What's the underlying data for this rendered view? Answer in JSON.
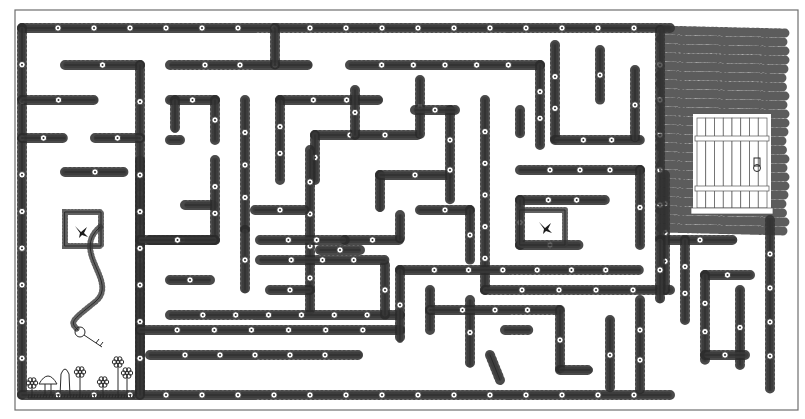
{
  "title": "Flower Vine Maze",
  "colors": {
    "ink": "#2a2a2a",
    "frame": "#6e6e6e",
    "background": "#ffffff"
  },
  "frame": {
    "x": 15,
    "y": 10,
    "w": 783,
    "h": 400
  },
  "walls": [
    [
      [
        22,
        28
      ],
      [
        670,
        28
      ]
    ],
    [
      [
        22,
        28
      ],
      [
        22,
        395
      ]
    ],
    [
      [
        22,
        395
      ],
      [
        670,
        395
      ]
    ],
    [
      [
        140,
        395
      ],
      [
        140,
        160
      ]
    ],
    [
      [
        22,
        100
      ],
      [
        95,
        100
      ]
    ],
    [
      [
        22,
        138
      ],
      [
        65,
        138
      ]
    ],
    [
      [
        65,
        65
      ],
      [
        140,
        65
      ]
    ],
    [
      [
        140,
        65
      ],
      [
        140,
        395
      ]
    ],
    [
      [
        95,
        138
      ],
      [
        140,
        138
      ]
    ],
    [
      [
        65,
        172
      ],
      [
        125,
        172
      ]
    ],
    [
      [
        170,
        65
      ],
      [
        310,
        65
      ]
    ],
    [
      [
        275,
        28
      ],
      [
        275,
        65
      ]
    ],
    [
      [
        170,
        100
      ],
      [
        215,
        100
      ]
    ],
    [
      [
        215,
        100
      ],
      [
        215,
        140
      ]
    ],
    [
      [
        170,
        140
      ],
      [
        180,
        140
      ]
    ],
    [
      [
        175,
        100
      ],
      [
        175,
        130
      ]
    ],
    [
      [
        245,
        100
      ],
      [
        245,
        230
      ]
    ],
    [
      [
        185,
        205
      ],
      [
        215,
        205
      ]
    ],
    [
      [
        215,
        160
      ],
      [
        215,
        240
      ]
    ],
    [
      [
        150,
        240
      ],
      [
        215,
        240
      ]
    ],
    [
      [
        140,
        240
      ],
      [
        215,
        240
      ]
    ],
    [
      [
        170,
        280
      ],
      [
        210,
        280
      ]
    ],
    [
      [
        245,
        230
      ],
      [
        245,
        290
      ]
    ],
    [
      [
        280,
        100
      ],
      [
        380,
        100
      ]
    ],
    [
      [
        280,
        100
      ],
      [
        280,
        180
      ]
    ],
    [
      [
        315,
        135
      ],
      [
        420,
        135
      ]
    ],
    [
      [
        315,
        135
      ],
      [
        315,
        180
      ]
    ],
    [
      [
        350,
        65
      ],
      [
        540,
        65
      ]
    ],
    [
      [
        420,
        80
      ],
      [
        420,
        135
      ]
    ],
    [
      [
        310,
        150
      ],
      [
        310,
        310
      ]
    ],
    [
      [
        255,
        210
      ],
      [
        305,
        210
      ]
    ],
    [
      [
        380,
        175
      ],
      [
        380,
        210
      ]
    ],
    [
      [
        380,
        175
      ],
      [
        450,
        175
      ]
    ],
    [
      [
        450,
        110
      ],
      [
        450,
        200
      ]
    ],
    [
      [
        415,
        110
      ],
      [
        455,
        110
      ]
    ],
    [
      [
        345,
        240
      ],
      [
        400,
        240
      ]
    ],
    [
      [
        400,
        215
      ],
      [
        400,
        240
      ]
    ],
    [
      [
        260,
        240
      ],
      [
        345,
        240
      ]
    ],
    [
      [
        355,
        90
      ],
      [
        355,
        135
      ]
    ],
    [
      [
        540,
        65
      ],
      [
        540,
        145
      ]
    ],
    [
      [
        485,
        100
      ],
      [
        485,
        290
      ]
    ],
    [
      [
        520,
        110
      ],
      [
        520,
        135
      ]
    ],
    [
      [
        555,
        45
      ],
      [
        555,
        140
      ]
    ],
    [
      [
        555,
        140
      ],
      [
        640,
        140
      ]
    ],
    [
      [
        600,
        50
      ],
      [
        600,
        100
      ]
    ],
    [
      [
        635,
        70
      ],
      [
        635,
        140
      ]
    ],
    [
      [
        520,
        170
      ],
      [
        640,
        170
      ]
    ],
    [
      [
        640,
        170
      ],
      [
        640,
        245
      ]
    ],
    [
      [
        520,
        200
      ],
      [
        605,
        200
      ]
    ],
    [
      [
        520,
        200
      ],
      [
        520,
        245
      ]
    ],
    [
      [
        520,
        245
      ],
      [
        580,
        245
      ]
    ],
    [
      [
        485,
        290
      ],
      [
        670,
        290
      ]
    ],
    [
      [
        420,
        210
      ],
      [
        470,
        210
      ]
    ],
    [
      [
        470,
        210
      ],
      [
        470,
        260
      ]
    ],
    [
      [
        140,
        330
      ],
      [
        400,
        330
      ]
    ],
    [
      [
        170,
        315
      ],
      [
        400,
        315
      ]
    ],
    [
      [
        385,
        265
      ],
      [
        385,
        315
      ]
    ],
    [
      [
        260,
        260
      ],
      [
        385,
        260
      ]
    ],
    [
      [
        270,
        290
      ],
      [
        310,
        290
      ]
    ],
    [
      [
        320,
        250
      ],
      [
        360,
        250
      ]
    ],
    [
      [
        150,
        355
      ],
      [
        360,
        355
      ]
    ],
    [
      [
        400,
        270
      ],
      [
        640,
        270
      ]
    ],
    [
      [
        400,
        270
      ],
      [
        400,
        340
      ]
    ],
    [
      [
        430,
        290
      ],
      [
        430,
        330
      ]
    ],
    [
      [
        470,
        300
      ],
      [
        470,
        365
      ]
    ],
    [
      [
        430,
        310
      ],
      [
        560,
        310
      ]
    ],
    [
      [
        560,
        310
      ],
      [
        560,
        370
      ]
    ],
    [
      [
        505,
        330
      ],
      [
        530,
        330
      ]
    ],
    [
      [
        490,
        355
      ],
      [
        500,
        380
      ]
    ],
    [
      [
        560,
        370
      ],
      [
        590,
        370
      ]
    ],
    [
      [
        665,
        240
      ],
      [
        735,
        240
      ]
    ],
    [
      [
        665,
        175
      ],
      [
        665,
        290
      ]
    ],
    [
      [
        685,
        240
      ],
      [
        685,
        320
      ]
    ],
    [
      [
        705,
        275
      ],
      [
        750,
        275
      ]
    ],
    [
      [
        705,
        275
      ],
      [
        705,
        360
      ]
    ],
    [
      [
        740,
        290
      ],
      [
        740,
        365
      ]
    ],
    [
      [
        705,
        355
      ],
      [
        745,
        355
      ]
    ],
    [
      [
        770,
        220
      ],
      [
        770,
        390
      ]
    ],
    [
      [
        610,
        320
      ],
      [
        610,
        390
      ]
    ],
    [
      [
        640,
        300
      ],
      [
        640,
        390
      ]
    ],
    [
      [
        660,
        30
      ],
      [
        660,
        240
      ]
    ],
    [
      [
        660,
        240
      ],
      [
        660,
        300
      ]
    ]
  ],
  "ivy_mass": {
    "x": 660,
    "y": 30,
    "w": 125,
    "h": 205
  },
  "door": {
    "x": 697,
    "y": 118,
    "w": 70,
    "h": 90,
    "planks": 8,
    "label": "exit-door"
  },
  "birds": [
    {
      "x": 82,
      "y": 232,
      "label": "bird-left"
    },
    {
      "x": 546,
      "y": 228,
      "label": "bird-right"
    }
  ],
  "start_box": {
    "x": 65,
    "y": 212,
    "w": 36,
    "h": 34
  },
  "goal_box": {
    "x": 520,
    "y": 210,
    "w": 45,
    "h": 35
  },
  "key": {
    "x": 80,
    "y": 332,
    "label": "key"
  },
  "ground": {
    "y": 398,
    "x1": 28,
    "x2": 135
  },
  "flowers": [
    {
      "x": 32,
      "y": 383
    },
    {
      "x": 80,
      "y": 372
    },
    {
      "x": 103,
      "y": 382
    },
    {
      "x": 118,
      "y": 362
    },
    {
      "x": 127,
      "y": 373
    }
  ],
  "mushroom": {
    "x": 48,
    "y": 392
  },
  "stone": {
    "x": 65,
    "y": 378
  }
}
